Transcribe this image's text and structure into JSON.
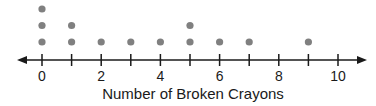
{
  "chart_data": {
    "type": "dot",
    "title": "",
    "xlabel": "Number of Broken Crayons",
    "ylabel": "",
    "categories": [
      0,
      1,
      2,
      3,
      4,
      5,
      6,
      7,
      8,
      9,
      10
    ],
    "values": [
      3,
      2,
      1,
      1,
      1,
      2,
      1,
      1,
      0,
      1,
      0
    ],
    "tick_labels": [
      "0",
      "2",
      "4",
      "6",
      "8",
      "10"
    ],
    "xlim": [
      0,
      10
    ],
    "grid": false,
    "legend": null,
    "dot_color": "#808080",
    "axis_color": "#1a1a1a"
  }
}
